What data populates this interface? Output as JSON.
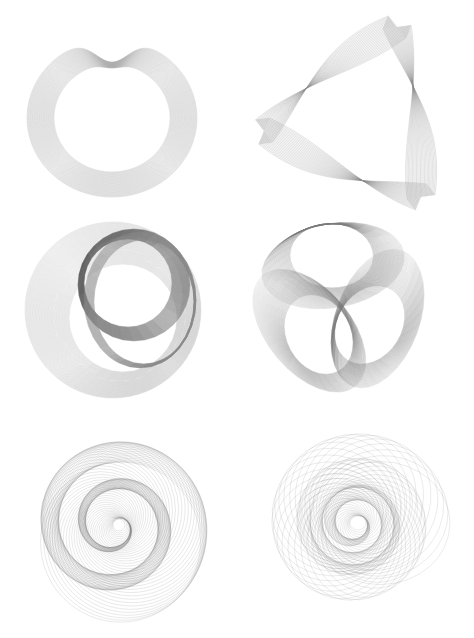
{
  "page": {
    "width": 474,
    "height": 638,
    "background": "#ffffff"
  },
  "figures": [
    {
      "id": "heart-ring",
      "description": "Cardioid-like heart ring made of concentric offset curves",
      "type": "heart",
      "center": [
        112,
        118
      ],
      "count": 40,
      "inner": 58,
      "outer": 85,
      "cusp_y": 62,
      "stroke": "#9a9a9a",
      "opacity": 0.45
    },
    {
      "id": "twisted-triangle",
      "description": "Twisted triangular ribbon of curved lines",
      "type": "triangle",
      "corners": [
        [
          397,
          27
        ],
        [
          264,
          131
        ],
        [
          421,
          197
        ]
      ],
      "count": 24,
      "spread": 28,
      "stroke": "#8a8a8a",
      "opacity": 0.5
    },
    {
      "id": "double-loop",
      "description": "Limacon with inner loop, light outer band and dark inner band",
      "type": "loop",
      "center": [
        113,
        310
      ],
      "count": 60,
      "outer_r": 88,
      "outer_band": 34,
      "inner_center": [
        128,
        283
      ],
      "inner_r": 44,
      "inner_band": 12,
      "stroke": "#8c8c8c",
      "inner_stroke": "#505050",
      "opacity": 0.35
    },
    {
      "id": "trefoil-ellipses",
      "description": "Three interlocking ribbon ellipses forming a trefoil",
      "type": "trefoil",
      "center": [
        340,
        305
      ],
      "count": 40,
      "rx": 72,
      "ry": 42,
      "offset": 40,
      "band": 0.42,
      "stroke": "#7a7a7a",
      "opacity": 0.3
    },
    {
      "id": "spiral-circles",
      "description": "Spiral of growing circles rotating around a center",
      "type": "spiral",
      "center": [
        115,
        525
      ],
      "count": 90,
      "min_r": 6,
      "max_r": 80,
      "offset": 14,
      "turns": 2.2,
      "stroke": "#6e6e6e",
      "opacity": 0.35
    },
    {
      "id": "rosette",
      "description": "Rosette of overlapping ellipses swirling around a center",
      "type": "rosette",
      "center": [
        355,
        523
      ],
      "count": 80,
      "min_r": 8,
      "max_r": 70,
      "offset": 22,
      "turns": 3,
      "stroke": "#7a7a7a",
      "opacity": 0.35
    }
  ]
}
